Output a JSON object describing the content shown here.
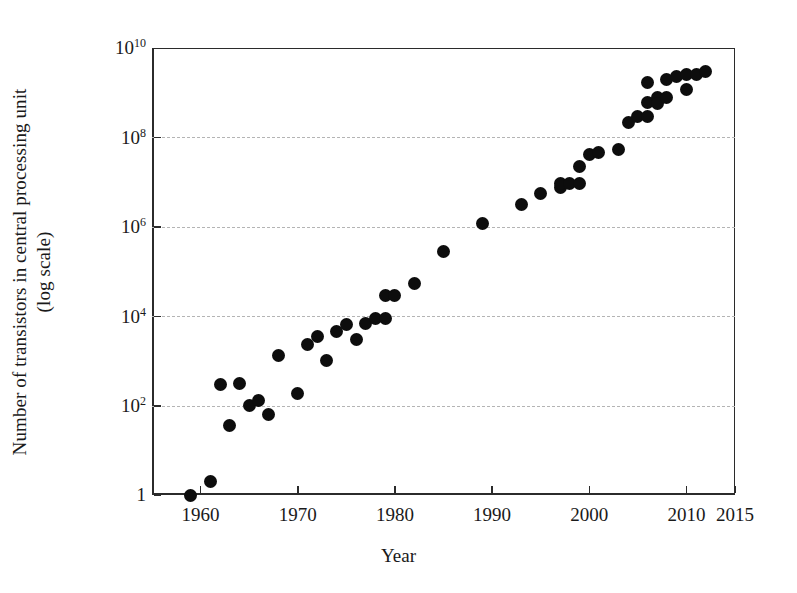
{
  "chart_data": {
    "type": "scatter",
    "title": "",
    "xlabel": "Year",
    "ylabel": "Number of transistors in central processing unit",
    "ylabel_line2": "(log scale)",
    "xlim": [
      1955,
      2015
    ],
    "ylim": [
      1,
      10000000000
    ],
    "yscale": "log",
    "grid": true,
    "grid_axis": "y",
    "grid_style": "dashed",
    "legend": "none",
    "marker": "filled-circle",
    "marker_color": "#0d0d0d",
    "xticks": [
      1960,
      1970,
      1980,
      1990,
      2000,
      2010,
      2015
    ],
    "xtick_labels": [
      "1960",
      "1970",
      "1980",
      "1990",
      "2000",
      "2010",
      "2015"
    ],
    "yticks": [
      1,
      100,
      10000,
      1000000,
      100000000,
      10000000000
    ],
    "ytick_labels": [
      "1",
      "10",
      "10",
      "10",
      "10",
      "10"
    ],
    "ytick_exponents": [
      "",
      "2",
      "4",
      "6",
      "8",
      "10"
    ],
    "gridline_values": [
      100,
      10000,
      1000000,
      100000000
    ],
    "x": [
      1959,
      1961,
      1962,
      1963,
      1964,
      1965,
      1966,
      1967,
      1968,
      1970,
      1971,
      1972,
      1973,
      1974,
      1975,
      1976,
      1977,
      1978,
      1979,
      1979,
      1980,
      1982,
      1985,
      1989,
      1993,
      1995,
      1997,
      1997,
      1998,
      1999,
      1999,
      2000,
      2001,
      2003,
      2004,
      2005,
      2006,
      2006,
      2006,
      2007,
      2007,
      2008,
      2008,
      2009,
      2010,
      2010,
      2011,
      2012
    ],
    "y": [
      1,
      2,
      300,
      35,
      320,
      100,
      130,
      64,
      1300,
      190,
      2300,
      3500,
      1000,
      4500,
      6500,
      3000,
      6800,
      9000,
      9000,
      29000,
      29000,
      55000,
      275000,
      1180000,
      3100000,
      5500000,
      7500000,
      9500000,
      9500000,
      22000000,
      9500000,
      42000000,
      45000000,
      55000000,
      220000000,
      290000000,
      590000000,
      1700000000,
      290000000,
      790000000,
      580000000,
      2000000000,
      800000000,
      2300000000,
      1200000000,
      2600000000,
      2600000000,
      3000000000
    ],
    "n_points": 48
  },
  "figure": {
    "background": "#ffffff",
    "axis_color": "#2b2b2b",
    "grid_color": "#b4b4b4"
  }
}
